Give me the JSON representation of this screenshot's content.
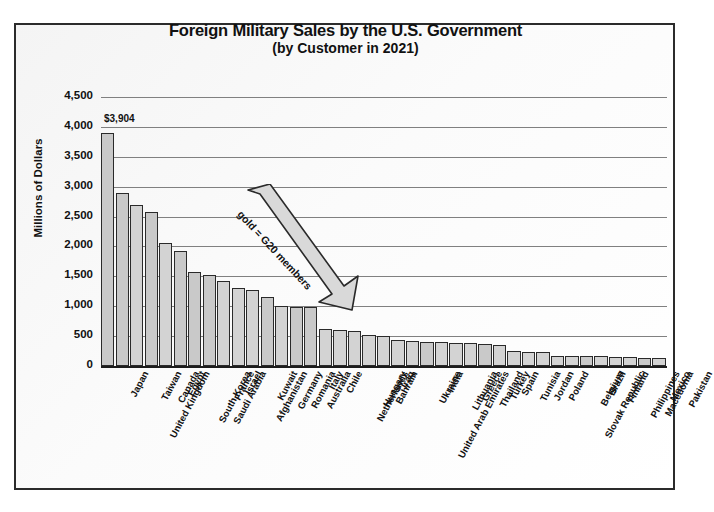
{
  "chart_data": {
    "type": "bar",
    "title": "Foreign Military Sales by the U.S. Government",
    "subtitle": "(by Customer in 2021)",
    "xlabel": "",
    "ylabel": "Millions of Dollars",
    "ylim": [
      0,
      4500
    ],
    "ytick_labels": [
      "4,500",
      "4,000",
      "3,500",
      "3,000",
      "2,500",
      "2,000",
      "1,500",
      "1,000",
      "500",
      "0"
    ],
    "ytick_values": [
      4500,
      4000,
      3500,
      3000,
      2500,
      2000,
      1500,
      1000,
      500,
      0
    ],
    "grid": true,
    "legend": "none",
    "annotation": "gold = G20 members",
    "data_labels": {
      "Japan": "$3,904"
    },
    "categories": [
      "Japan",
      "United Kingdom",
      "Taiwan",
      "Canada",
      "Egypt",
      "South Korea",
      "Saudi Arabia",
      "France",
      "Israel",
      "Afghanistan",
      "Kuwait",
      "Germany",
      "Romania",
      "Australia",
      "Italy",
      "Chile",
      "Netherlands",
      "Hungary",
      "Bahrain",
      "Iraq",
      "United Arab Emirates",
      "Ukraine",
      "India",
      "Lithuania",
      "Greece",
      "Thailand",
      "Turkey",
      "Spain",
      "Tunisia",
      "Jordan",
      "Poland",
      "Slovak Republic",
      "Belgium",
      "Brazil",
      "Finland",
      "Philippines",
      "Macedonia",
      "Mexico",
      "Pakistan"
    ],
    "values": [
      3904,
      2900,
      2700,
      2580,
      2050,
      1930,
      1580,
      1520,
      1420,
      1310,
      1270,
      1150,
      1010,
      990,
      980,
      620,
      600,
      580,
      520,
      500,
      440,
      420,
      410,
      400,
      390,
      380,
      370,
      350,
      250,
      240,
      230,
      175,
      170,
      165,
      160,
      150,
      145,
      140,
      130
    ],
    "g20_members": [
      "Japan",
      "United Kingdom",
      "Canada",
      "South Korea",
      "Saudi Arabia",
      "France",
      "Germany",
      "Australia",
      "Italy",
      "India",
      "Turkey",
      "Brazil",
      "Mexico"
    ]
  }
}
